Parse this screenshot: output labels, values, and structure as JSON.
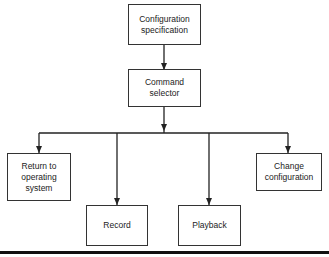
{
  "diagram": {
    "type": "flowchart",
    "nodes": [
      {
        "id": "config_spec",
        "label": "Configuration\nspecification"
      },
      {
        "id": "command_selector",
        "label": "Command\nselector"
      },
      {
        "id": "return_os",
        "label": "Return to\noperating\nsystem"
      },
      {
        "id": "record",
        "label": "Record"
      },
      {
        "id": "playback",
        "label": "Playback"
      },
      {
        "id": "change_config",
        "label": "Change\nconfiguration"
      }
    ],
    "edges": [
      {
        "from": "config_spec",
        "to": "command_selector"
      },
      {
        "from": "command_selector",
        "to": "return_os"
      },
      {
        "from": "command_selector",
        "to": "record"
      },
      {
        "from": "command_selector",
        "to": "playback"
      },
      {
        "from": "command_selector",
        "to": "change_config"
      }
    ]
  }
}
